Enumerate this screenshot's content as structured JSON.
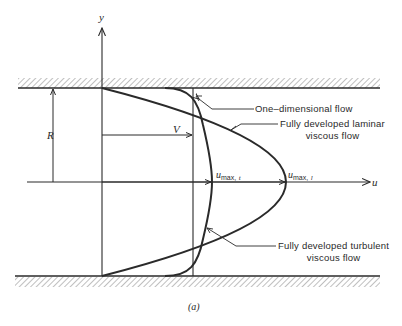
{
  "figure": {
    "caption": "(a)",
    "colors": {
      "ink": "#2a2a2a",
      "hatch": "#8a8a8a",
      "background": "#ffffff"
    }
  },
  "axes": {
    "y_label": "y",
    "x_label": "u"
  },
  "dimensions": {
    "radius_label": "R",
    "uniform_velocity_label": "V"
  },
  "velocity_markers": {
    "turbulent_max": {
      "base": "u",
      "subscript": "max,",
      "subscript_var": "t"
    },
    "laminar_max": {
      "base": "u",
      "subscript": "max,",
      "subscript_var": "l"
    }
  },
  "callouts": [
    {
      "id": "one-dimensional",
      "line1": "One–dimensional flow",
      "line2": ""
    },
    {
      "id": "laminar",
      "line1": "Fully developed laminar",
      "line2": "viscous flow"
    },
    {
      "id": "turbulent",
      "line1": "Fully developed turbulent",
      "line2": "viscous flow"
    }
  ],
  "walls": [
    {
      "id": "top-wall",
      "position": "top"
    },
    {
      "id": "bottom-wall",
      "position": "bottom"
    }
  ]
}
